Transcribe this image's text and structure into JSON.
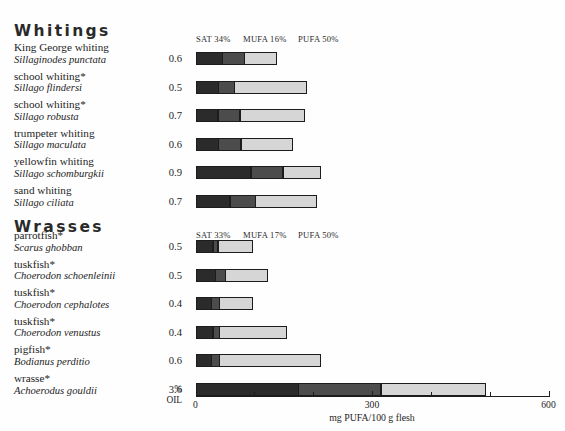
{
  "chart_data": {
    "type": "bar",
    "title": "",
    "subtitle": "",
    "xlabel": "mg PUFA/100 g flesh",
    "ylabel": "",
    "xlim": [
      0,
      600
    ],
    "xticks": [
      0,
      100,
      200,
      300,
      400,
      500,
      600
    ],
    "xtick_labels": [
      "0",
      "",
      "",
      "300",
      "",
      "",
      "600"
    ],
    "grid": false,
    "legend_position": "top",
    "stacked": true,
    "series": [
      {
        "name": "SAT",
        "color": "#2b2b2b"
      },
      {
        "name": "MUFA",
        "color": "#4c4c4c"
      },
      {
        "name": "PUFA",
        "color": "#d6d6d6"
      }
    ],
    "oil_axis_label": [
      "%",
      "OIL"
    ],
    "groups": [
      {
        "name": "Whitings",
        "composition": {
          "sat": "SAT 34%",
          "mufa": "MUFA 16%",
          "pufa": "PUFA 50%"
        },
        "rows": [
          {
            "common": "King George whiting",
            "scientific": "Sillaginodes punctata",
            "oil": "0.6",
            "sat": 46,
            "mufa": 39,
            "pufa": 56,
            "total": 141
          },
          {
            "common": "school whiting*",
            "scientific": "Sillago flindersi",
            "oil": "0.5",
            "sat": 40,
            "mufa": 28,
            "pufa": 123,
            "total": 191
          },
          {
            "common": "school whiting*",
            "scientific": "Sillago robusta",
            "oil": "0.7",
            "sat": 39,
            "mufa": 38,
            "pufa": 111,
            "total": 188
          },
          {
            "common": "trumpeter whiting",
            "scientific": "Sillago maculata",
            "oil": "0.6",
            "sat": 40,
            "mufa": 39,
            "pufa": 89,
            "total": 168
          },
          {
            "common": "yellowfin whiting",
            "scientific": "Sillago schomburgkii",
            "oil": "0.9",
            "sat": 95,
            "mufa": 55,
            "pufa": 66,
            "total": 216
          },
          {
            "common": "sand whiting",
            "scientific": "Sillago ciliata",
            "oil": "0.7",
            "sat": 59,
            "mufa": 45,
            "pufa": 105,
            "total": 209
          }
        ]
      },
      {
        "name": "Wrasses",
        "composition": {
          "sat": "SAT 33%",
          "mufa": "MUFA 17%",
          "pufa": "PUFA 50%"
        },
        "rows": [
          {
            "common": "parrotfish*",
            "scientific": "Scarus ghobban",
            "oil": "0.5",
            "sat": 30,
            "mufa": 10,
            "pufa": 60,
            "total": 100
          },
          {
            "common": "tuskfish*",
            "scientific": "Choerodon schoenleinii",
            "oil": "0.5",
            "sat": 35,
            "mufa": 18,
            "pufa": 72,
            "total": 125
          },
          {
            "common": "tuskfish*",
            "scientific": "Choerodon cephalotes",
            "oil": "0.4",
            "sat": 28,
            "mufa": 14,
            "pufa": 58,
            "total": 100
          },
          {
            "common": "tuskfish*",
            "scientific": "Choerodon venustus",
            "oil": "0.4",
            "sat": 30,
            "mufa": 12,
            "pufa": 116,
            "total": 158
          },
          {
            "common": "pigfish*",
            "scientific": "Bodianus perditio",
            "oil": "0.6",
            "sat": 28,
            "mufa": 14,
            "pufa": 173,
            "total": 215
          },
          {
            "common": "wrasse*",
            "scientific": "Achoerodus gouldii",
            "oil": "3.6",
            "sat": 176,
            "mufa": 141,
            "pufa": 179,
            "total": 496
          }
        ]
      }
    ]
  }
}
